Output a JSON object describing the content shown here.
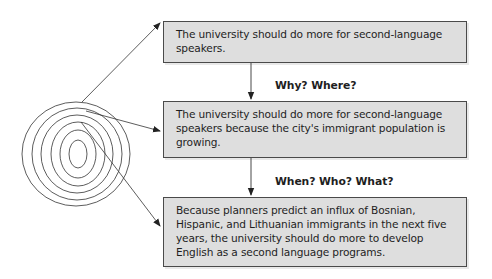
{
  "diagram": {
    "type": "focusing-funnel",
    "colors": {
      "box_fill": "#dedede",
      "box_border": "#4a4a4a",
      "line": "#333333",
      "text": "#1e1e1e"
    },
    "boxes": [
      {
        "text": "The university should do more for second-language speakers."
      },
      {
        "text": "The university should do more for second-language speakers because the city's immigrant population is growing."
      },
      {
        "text": "Because planners predict an influx of Bosnian, Hispanic, and Lithuanian immigrants in the next five years, the university should do more to develop English as a second language programs."
      }
    ],
    "connectors": [
      {
        "label": "Why? Where?"
      },
      {
        "label": "When? Who? What?"
      }
    ],
    "target_icon": "concentric-ellipses-icon"
  }
}
